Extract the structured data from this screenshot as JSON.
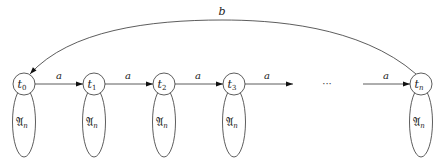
{
  "diagram": {
    "type": "automaton",
    "states": [
      {
        "id": "t0",
        "base": "t",
        "sub": "0",
        "cx": 24,
        "self_label": "𝔄",
        "self_sub": "n"
      },
      {
        "id": "t1",
        "base": "t",
        "sub": "1",
        "cx": 94,
        "self_label": "𝔄",
        "self_sub": "n"
      },
      {
        "id": "t2",
        "base": "t",
        "sub": "2",
        "cx": 164,
        "self_label": "𝔄",
        "self_sub": "n"
      },
      {
        "id": "t3",
        "base": "t",
        "sub": "3",
        "cx": 234,
        "self_label": "𝔄",
        "self_sub": "n"
      },
      {
        "id": "tn",
        "base": "t",
        "sub": "n",
        "cx": 421,
        "self_label": "𝔄",
        "self_sub": "n"
      }
    ],
    "edges": [
      {
        "from": "t0",
        "to": "t1",
        "label": "a"
      },
      {
        "from": "t1",
        "to": "t2",
        "label": "a"
      },
      {
        "from": "t2",
        "to": "t3",
        "label": "a"
      },
      {
        "from": "t3",
        "to": "ellipsis",
        "label": "a"
      },
      {
        "from": "ellipsis",
        "to": "tn",
        "label": "a"
      },
      {
        "from": "tn",
        "to": "t0",
        "label": "b",
        "curved": true
      }
    ],
    "ellipsis": "···"
  }
}
